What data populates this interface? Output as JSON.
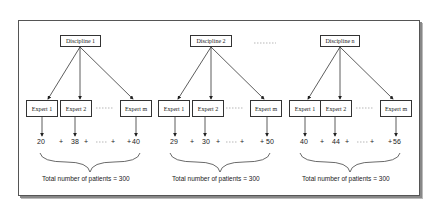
{
  "diagram": {
    "groups": [
      {
        "discipline": "Discipline 1",
        "experts": [
          "Expert 1",
          "Expert 2",
          "Expert m"
        ],
        "counts": [
          "20",
          "38",
          "40"
        ],
        "operators": [
          "+",
          "+",
          "+",
          "+"
        ],
        "total": "Total number of patients = 300"
      },
      {
        "discipline": "Discipline 2",
        "experts": [
          "Expert 1",
          "Expert 2",
          "Expert m"
        ],
        "counts": [
          "29",
          "30",
          "50"
        ],
        "operators": [
          "+",
          "+",
          "+",
          "+"
        ],
        "total": "Total number of patients = 300"
      },
      {
        "discipline": "Discipline n",
        "experts": [
          "Expert 1",
          "Expert 2",
          "Expert m"
        ],
        "counts": [
          "40",
          "44",
          "56"
        ],
        "operators": [
          "+",
          "+",
          "+",
          "+"
        ],
        "total": "Total number of patients = 300"
      }
    ]
  }
}
